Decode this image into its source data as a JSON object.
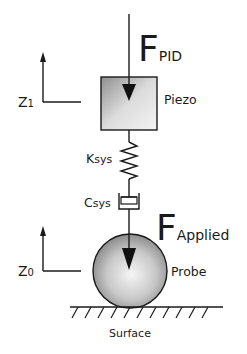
{
  "diagram": {
    "type": "mechanical-schematic",
    "labels": {
      "force_pid_main": "F",
      "force_pid_sub": "PID",
      "force_applied_main": "F",
      "force_applied_sub": "Applied",
      "piezo": "Piezo",
      "k_main": "K",
      "k_sub": "sys",
      "c_main": "C",
      "c_sub": "sys",
      "z1_main": "Z",
      "z1_sub": "1",
      "z0_main": "Z",
      "z0_sub": "0",
      "probe": "Probe",
      "surface": "Surface"
    },
    "colors": {
      "stroke": "#1a1a1a",
      "box_fill_light": "#eeeeee",
      "box_fill_dark": "#9a9a9a",
      "sphere_light": "#f2f2f2",
      "sphere_dark": "#8c8c8c"
    }
  }
}
